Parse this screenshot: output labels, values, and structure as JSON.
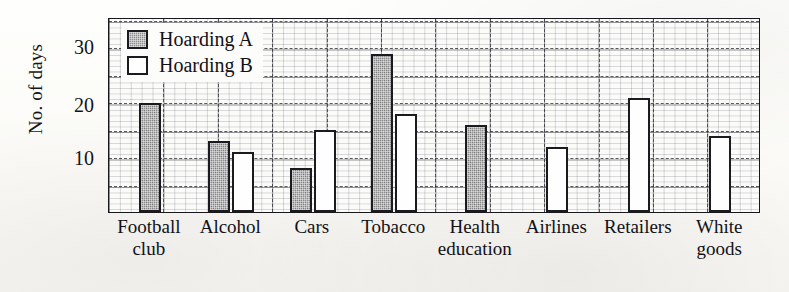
{
  "chart_data": {
    "type": "bar",
    "title": "",
    "xlabel": "",
    "ylabel": "No. of days",
    "ylim": [
      0,
      35
    ],
    "grid": "graph-paper grid with dashed major lines",
    "legend_position": "top-left inside plot",
    "categories": [
      "Football club",
      "Alcohol",
      "Cars",
      "Tobacco",
      "Health education",
      "Airlines",
      "Retailers",
      "White goods"
    ],
    "series": [
      {
        "name": "Hoarding A",
        "color": "#8d8d8d",
        "values": [
          20,
          13,
          8,
          29,
          16,
          0,
          0,
          0
        ]
      },
      {
        "name": "Hoarding B",
        "color": "#fefefe",
        "values": [
          0,
          11,
          15,
          18,
          0,
          12,
          21,
          14
        ]
      }
    ],
    "yticks": [
      10,
      20,
      30
    ],
    "ytick_labels": [
      "10",
      "20",
      "30"
    ]
  },
  "axis": {
    "y_title": "No. of days",
    "y_ticks": [
      {
        "label": "30",
        "value": 30
      },
      {
        "label": "20",
        "value": 20
      },
      {
        "label": "10",
        "value": 10
      }
    ]
  },
  "legend": {
    "items": [
      {
        "label": "Hoarding A",
        "swatch": "filled-gray-square"
      },
      {
        "label": "Hoarding B",
        "swatch": "empty-white-square"
      }
    ]
  },
  "x_axis": {
    "categories": [
      {
        "line1": "Football",
        "line2": "club"
      },
      {
        "line1": "Alcohol",
        "line2": ""
      },
      {
        "line1": "Cars",
        "line2": ""
      },
      {
        "line1": "Tobacco",
        "line2": ""
      },
      {
        "line1": "Health",
        "line2": "education"
      },
      {
        "line1": "Airlines",
        "line2": ""
      },
      {
        "line1": "Retailers",
        "line2": ""
      },
      {
        "line1": "White",
        "line2": "goods"
      }
    ]
  },
  "colors": {
    "series_a_fill": "#8d8d8d",
    "series_b_fill": "#fefefe",
    "bar_outline": "#1a1a1f",
    "grid": "#282830",
    "text": "#121216",
    "paper": "#fbfaf7"
  }
}
